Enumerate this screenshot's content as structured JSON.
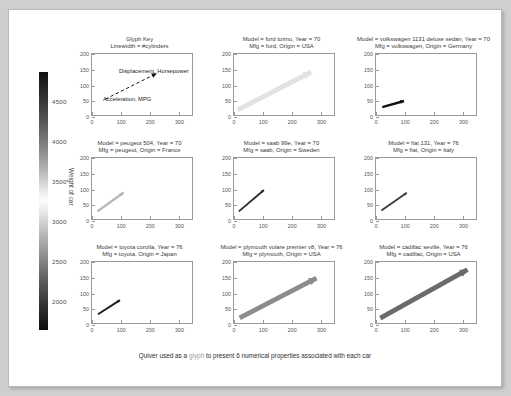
{
  "figure": {
    "caption_before": "Quiver used as a ",
    "caption_glyph": "glyph",
    "caption_after": " to present 6 numerical properties associated with each car",
    "accent_color": "#3a3a3a"
  },
  "colorbar": {
    "title": "Weight of car",
    "ticks": [
      "4500",
      "4000",
      "3500",
      "3000",
      "2500",
      "2000"
    ],
    "tick_values": [
      4500,
      4000,
      3500,
      3000,
      2500,
      2000
    ],
    "range": [
      1600,
      5000
    ],
    "colormap": "gray-cyclic"
  },
  "axes_common": {
    "xticks": [
      "0",
      "100",
      "200",
      "300"
    ],
    "yticks": [
      "0",
      "50",
      "100",
      "150",
      "200"
    ],
    "xlim": [
      0,
      350
    ],
    "ylim": [
      0,
      200
    ]
  },
  "glyph_key": {
    "title_line1": "Glyph Key",
    "title_line2": "Linewidth = #cylinders",
    "label_tail": "Acceleration, MPG",
    "label_head": "Displacement, Horsepower"
  },
  "chart_data": {
    "type": "scatter",
    "title": "Quiver used as a glyph to present 6 numerical properties associated with each car",
    "xlabel": "",
    "ylabel": "",
    "xlim": [
      0,
      350
    ],
    "ylim": [
      0,
      200
    ],
    "grid": false,
    "legend": "colorbar",
    "encoding": {
      "tail_x": "Acceleration",
      "tail_y": "MPG",
      "head_x": "Displacement",
      "head_y": "Horsepower",
      "linewidth": "#cylinders",
      "color": "Weight of car"
    },
    "panels": [
      {
        "slot": 0,
        "kind": "key",
        "title_line1": "Glyph Key",
        "title_line2": "Linewidth = #cylinders"
      },
      {
        "slot": 1,
        "kind": "car",
        "model": "ford torino",
        "year": "70",
        "mfg": "ford",
        "origin": "USA",
        "title_line1": "Model = ford torino, Year = 70",
        "title_line2": "Mfg = ford, Origin = USA",
        "tail": [
          11,
          17
        ],
        "head": [
          271,
          141
        ],
        "linewidth": 8,
        "color": "#e2e2e2"
      },
      {
        "slot": 2,
        "kind": "car",
        "model": "volkswagen 1131 deluxe sedan",
        "year": "70",
        "mfg": "volkswagen",
        "origin": "Germany",
        "title_line1": "Model = volkswagen 1131 deluxe sedan, Year = 70",
        "title_line2": "Mfg = volkswagen, Origin = Germany",
        "tail": [
          20,
          26
        ],
        "head": [
          97,
          46
        ],
        "linewidth": 4,
        "color": "#121212"
      },
      {
        "slot": 3,
        "kind": "car",
        "model": "peugeot 504",
        "year": "70",
        "mfg": "peugeot",
        "origin": "France",
        "title_line1": "Model = peugeot 504, Year = 70",
        "title_line2": "Mfg = peugeot, Origin = France",
        "tail": [
          17,
          25
        ],
        "head": [
          110,
          87
        ],
        "linewidth": 4,
        "color": "#b8b8b8"
      },
      {
        "slot": 4,
        "kind": "car",
        "model": "saab 99e",
        "year": "70",
        "mfg": "saab",
        "origin": "Sweden",
        "title_line1": "Model = saab 99e, Year = 70",
        "title_line2": "Mfg = saab, Origin = Sweden",
        "tail": [
          15,
          25
        ],
        "head": [
          104,
          95
        ],
        "linewidth": 3,
        "color": "#2a2a2a"
      },
      {
        "slot": 5,
        "kind": "car",
        "model": "fiat 131",
        "year": "76",
        "mfg": "fiat",
        "origin": "Italy",
        "title_line1": "Model = fiat 131, Year = 76",
        "title_line2": "Mfg = fiat, Origin = Italy",
        "tail": [
          17,
          28
        ],
        "head": [
          107,
          86
        ],
        "linewidth": 3,
        "color": "#3a3a3a"
      },
      {
        "slot": 6,
        "kind": "car",
        "model": "toyota corolla",
        "year": "76",
        "mfg": "toyota",
        "origin": "Japan",
        "title_line1": "Model = toyota corolla, Year = 76",
        "title_line2": "Mfg = toyota, Origin = Japan",
        "tail": [
          19,
          29
        ],
        "head": [
          97,
          75
        ],
        "linewidth": 3,
        "color": "#1a1a1a"
      },
      {
        "slot": 7,
        "kind": "car",
        "model": "plymouth volare premier v8",
        "year": "76",
        "mfg": "plymouth",
        "origin": "USA",
        "title_line1": "Model = plymouth volare premier v8, Year = 76",
        "title_line2": "Mfg = plymouth, Origin = USA",
        "tail": [
          18,
          17
        ],
        "head": [
          290,
          147
        ],
        "linewidth": 8,
        "color": "#8c8c8c"
      },
      {
        "slot": 8,
        "kind": "car",
        "model": "cadillac seville",
        "year": "76",
        "mfg": "cadillac",
        "origin": "USA",
        "title_line1": "Model = cadillac seville, Year = 76",
        "title_line2": "Mfg = cadillac, Origin = USA",
        "tail": [
          13,
          16
        ],
        "head": [
          322,
          175
        ],
        "linewidth": 8,
        "color": "#6b6b6b"
      }
    ]
  }
}
